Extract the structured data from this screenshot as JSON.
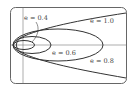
{
  "diagram": {
    "labels": [
      {
        "id": "e04",
        "text": "e = 0.4",
        "x": 24,
        "y": 20
      },
      {
        "id": "e10",
        "text": "e = 1.0",
        "x": 91,
        "y": 22
      },
      {
        "id": "e06",
        "text": "e = 0.6",
        "x": 52,
        "y": 54
      },
      {
        "id": "e08",
        "text": "e = 0.8",
        "x": 90,
        "y": 62
      }
    ],
    "curves": [
      {
        "e": 0.4,
        "type": "ellipse"
      },
      {
        "e": 0.6,
        "type": "ellipse"
      },
      {
        "e": 0.8,
        "type": "ellipse"
      },
      {
        "e": 1.0,
        "type": "parabola"
      }
    ],
    "colors": {
      "stroke": "#333333",
      "frame": "#555555",
      "axis": "#666666"
    }
  }
}
